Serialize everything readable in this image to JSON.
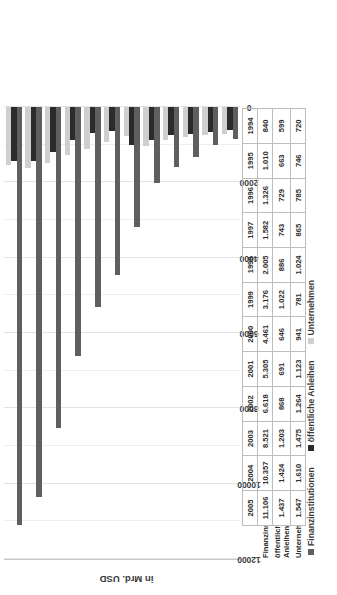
{
  "chart_data": {
    "type": "bar",
    "orientation": "vertical-rotated",
    "title": "",
    "xlabel": "",
    "ylabel": "in Mrd. USD",
    "ylim": [
      0,
      12000
    ],
    "yticks": [
      "0",
      "2000",
      "4000",
      "6000",
      "8000",
      "10000",
      "12000"
    ],
    "grid": true,
    "legend_position": "bottom",
    "categories": [
      "1994",
      "1995",
      "1996",
      "1997",
      "1998",
      "1999",
      "2000",
      "2001",
      "2002",
      "2003",
      "2004",
      "2005"
    ],
    "series": [
      {
        "name": "Finanzinstitutionen",
        "color": "#5f5f5f",
        "labels": [
          "840",
          "1.010",
          "1.326",
          "1.582",
          "2.005",
          "3.176",
          "4.461",
          "5.305",
          "6.618",
          "8.521",
          "10.357",
          "11.106"
        ],
        "values": [
          840,
          1010,
          1326,
          1582,
          2005,
          3176,
          4461,
          5305,
          6618,
          8521,
          10357,
          11106
        ]
      },
      {
        "name": "öffentliche Anleihen",
        "color": "#2b2b2b",
        "labels": [
          "599",
          "663",
          "729",
          "743",
          "886",
          "1.022",
          "646",
          "691",
          "868",
          "1.203",
          "1.424",
          "1.437"
        ],
        "values": [
          599,
          663,
          729,
          743,
          886,
          1022,
          646,
          691,
          868,
          1203,
          1424,
          1437
        ]
      },
      {
        "name": "Unternehmen",
        "color": "#cfcfcf",
        "labels": [
          "720",
          "746",
          "785",
          "865",
          "1.024",
          "781",
          "941",
          "1.123",
          "1.264",
          "1.475",
          "1.610",
          "1.547"
        ],
        "values": [
          720,
          746,
          785,
          865,
          1024,
          781,
          941,
          1123,
          1264,
          1475,
          1610,
          1547
        ]
      }
    ]
  },
  "axis": {
    "y_title": "in Mrd. USD"
  },
  "legend": {
    "items": [
      {
        "label": "Finanzinstitutionen"
      },
      {
        "label": "öffentliche Anleihen"
      },
      {
        "label": "Unternehmen"
      }
    ]
  },
  "table": {
    "row_labels": [
      "Finanzinstitutionen",
      "öffentliche Anleihen",
      "Unternehmen"
    ]
  }
}
